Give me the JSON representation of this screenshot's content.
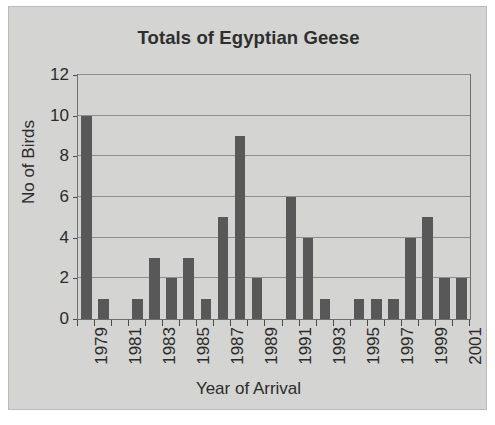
{
  "figure": {
    "background_color": "#d4d4d2",
    "plot_background_color": "#d4d4d2",
    "bar_color": "#585858",
    "axis_color": "#4a4a4a",
    "gridline_color": "#8d8d8b"
  },
  "chart_data": {
    "type": "bar",
    "title": "Totals of Egyptian Geese",
    "xlabel": "Year of Arrival",
    "ylabel": "No of Birds",
    "categories": [
      "1979",
      "1980",
      "1981",
      "1982",
      "1983",
      "1984",
      "1985",
      "1986",
      "1987",
      "1988",
      "1989",
      "1990",
      "1991",
      "1992",
      "1993",
      "1994",
      "1995",
      "1996",
      "1997",
      "1998",
      "1999",
      "2000",
      "2001"
    ],
    "values": [
      10,
      1,
      0,
      1,
      3,
      2,
      3,
      1,
      5,
      9,
      2,
      0,
      6,
      4,
      1,
      0,
      1,
      1,
      1,
      4,
      5,
      2,
      2
    ],
    "ylim": [
      0,
      12
    ],
    "yticks": [
      0,
      2,
      4,
      6,
      8,
      10,
      12
    ],
    "ytick_labels": [
      "0",
      "2",
      "4",
      "6",
      "8",
      "10",
      "12"
    ],
    "xtick_labels": [
      "1979",
      "1981",
      "1983",
      "1985",
      "1987",
      "1989",
      "1991",
      "1993",
      "1995",
      "1997",
      "1999",
      "2001"
    ],
    "xtick_label_rotation": "-90",
    "grid": "horizontal",
    "legend": "none",
    "series_name": "No of Birds"
  }
}
